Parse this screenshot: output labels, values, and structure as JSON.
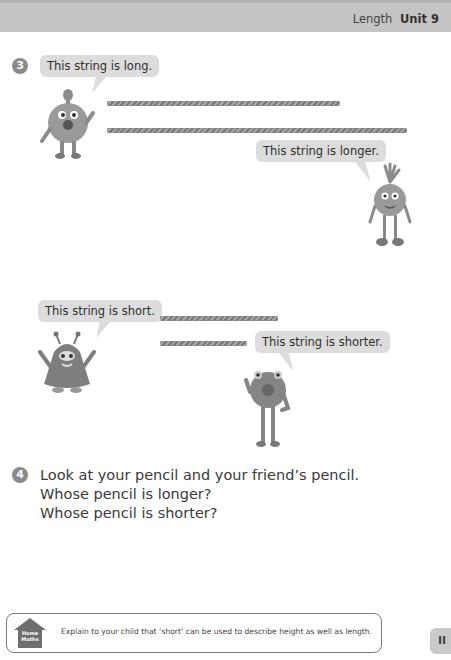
{
  "header": {
    "section": "Length",
    "unit": "Unit 9"
  },
  "exercise3": {
    "number": "3",
    "bubbles": {
      "long": "This string is long.",
      "longer": "This string is longer.",
      "short": "This string is short.",
      "shorter": "This string is shorter."
    }
  },
  "exercise4": {
    "number": "4",
    "lines": [
      "Look at your pencil and your friend’s pencil.",
      "Whose pencil is longer?",
      "Whose pencil is shorter?"
    ]
  },
  "home_maths": {
    "icon_label_1": "Home",
    "icon_label_2": "Maths",
    "note": "Explain to your child that ‘short’ can be used to describe height as well as length."
  },
  "page": {
    "number": "II"
  },
  "colors": {
    "header_bg": "#c4c4c4",
    "bubble_bg": "#dcdcdc",
    "number_circle": "#8a8a8a",
    "string": "#8a8a8a"
  }
}
